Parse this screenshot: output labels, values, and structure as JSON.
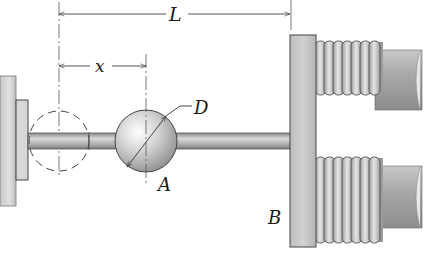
{
  "figure": {
    "type": "mechanical-diagram"
  },
  "labels": {
    "length": "L",
    "position": "x",
    "diameter": "D",
    "sphere": "A",
    "plate": "B"
  },
  "dimensions": {
    "L": {
      "label": "L",
      "from": "wall-centerline",
      "to": "plate-B-face"
    },
    "x": {
      "label": "x",
      "from": "wall-centerline",
      "to": "sphere-center"
    },
    "D": {
      "label": "D",
      "refers_to": "sphere-diameter"
    }
  },
  "components": {
    "wall": "fixed support",
    "rod": "horizontal rod",
    "sphere": "sphere A (diameter D)",
    "ghost_sphere": "dashed initial sphere position",
    "plate": "plate B",
    "springs": [
      "upper coil spring",
      "lower coil spring"
    ],
    "spring_coils": 7
  },
  "colors": {
    "line": "#333333",
    "fill_light": "#d6d6d6",
    "fill_mid": "#b9b9b9",
    "fill_dark": "#8e8e8e"
  }
}
